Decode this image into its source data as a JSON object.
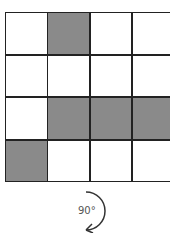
{
  "grid": {
    "rows": 4,
    "cols": 4,
    "filled": [
      [
        0,
        1
      ],
      [
        2,
        1
      ],
      [
        2,
        2
      ],
      [
        2,
        3
      ],
      [
        3,
        0
      ]
    ],
    "fill_color": "#8a8a8a",
    "line_color": "#222222"
  },
  "rotation": {
    "label": "90°",
    "direction": "clockwise"
  }
}
